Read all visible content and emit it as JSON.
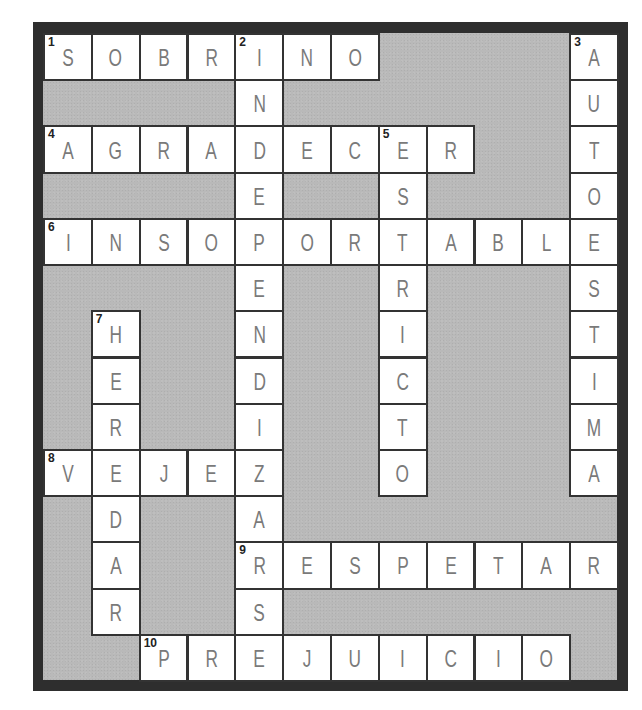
{
  "puzzle": {
    "type": "crossword",
    "columns": 12,
    "rows": 14,
    "colors": {
      "border": "#2e2e2e",
      "block": "#b9b9b9",
      "cell": "#ffffff",
      "letter": "#7a7a7a",
      "number": "#222222"
    }
  },
  "words": [
    {
      "number": 1,
      "direction": "across",
      "answer": "SOBRINO",
      "row": 0,
      "col": 0
    },
    {
      "number": 2,
      "direction": "down",
      "answer": "INDEPENDIZARS",
      "row": 0,
      "col": 4
    },
    {
      "number": 3,
      "direction": "down",
      "answer": "AUTOESTIMA",
      "row": 0,
      "col": 11
    },
    {
      "number": 4,
      "direction": "across",
      "answer": "AGRADECER",
      "row": 2,
      "col": 0
    },
    {
      "number": 5,
      "direction": "down",
      "answer": "ESTRICTO",
      "row": 2,
      "col": 7
    },
    {
      "number": 6,
      "direction": "across",
      "answer": "INSOPORTABLE",
      "row": 4,
      "col": 0
    },
    {
      "number": 7,
      "direction": "down",
      "answer": "HEREDAR",
      "row": 6,
      "col": 1
    },
    {
      "number": 8,
      "direction": "across",
      "answer": "VEJEZ",
      "row": 9,
      "col": 0
    },
    {
      "number": 9,
      "direction": "across",
      "answer": "RESPETAR",
      "row": 11,
      "col": 4
    },
    {
      "number": 10,
      "direction": "across",
      "answer": "PREJUICIO",
      "row": 13,
      "col": 2
    }
  ],
  "cells": [
    {
      "r": 0,
      "c": 0,
      "letter": "S",
      "num": "1"
    },
    {
      "r": 0,
      "c": 1,
      "letter": "O"
    },
    {
      "r": 0,
      "c": 2,
      "letter": "B"
    },
    {
      "r": 0,
      "c": 3,
      "letter": "R"
    },
    {
      "r": 0,
      "c": 4,
      "letter": "I",
      "num": "2"
    },
    {
      "r": 0,
      "c": 5,
      "letter": "N"
    },
    {
      "r": 0,
      "c": 6,
      "letter": "O"
    },
    {
      "r": 0,
      "c": 11,
      "letter": "A",
      "num": "3"
    },
    {
      "r": 1,
      "c": 4,
      "letter": "N"
    },
    {
      "r": 1,
      "c": 11,
      "letter": "U"
    },
    {
      "r": 2,
      "c": 0,
      "letter": "A",
      "num": "4"
    },
    {
      "r": 2,
      "c": 1,
      "letter": "G"
    },
    {
      "r": 2,
      "c": 2,
      "letter": "R"
    },
    {
      "r": 2,
      "c": 3,
      "letter": "A"
    },
    {
      "r": 2,
      "c": 4,
      "letter": "D"
    },
    {
      "r": 2,
      "c": 5,
      "letter": "E"
    },
    {
      "r": 2,
      "c": 6,
      "letter": "C"
    },
    {
      "r": 2,
      "c": 7,
      "letter": "E",
      "num": "5"
    },
    {
      "r": 2,
      "c": 8,
      "letter": "R"
    },
    {
      "r": 2,
      "c": 11,
      "letter": "T"
    },
    {
      "r": 3,
      "c": 4,
      "letter": "E"
    },
    {
      "r": 3,
      "c": 7,
      "letter": "S"
    },
    {
      "r": 3,
      "c": 11,
      "letter": "O"
    },
    {
      "r": 4,
      "c": 0,
      "letter": "I",
      "num": "6"
    },
    {
      "r": 4,
      "c": 1,
      "letter": "N"
    },
    {
      "r": 4,
      "c": 2,
      "letter": "S"
    },
    {
      "r": 4,
      "c": 3,
      "letter": "O"
    },
    {
      "r": 4,
      "c": 4,
      "letter": "P"
    },
    {
      "r": 4,
      "c": 5,
      "letter": "O"
    },
    {
      "r": 4,
      "c": 6,
      "letter": "R"
    },
    {
      "r": 4,
      "c": 7,
      "letter": "T"
    },
    {
      "r": 4,
      "c": 8,
      "letter": "A"
    },
    {
      "r": 4,
      "c": 9,
      "letter": "B"
    },
    {
      "r": 4,
      "c": 10,
      "letter": "L"
    },
    {
      "r": 4,
      "c": 11,
      "letter": "E"
    },
    {
      "r": 5,
      "c": 4,
      "letter": "E"
    },
    {
      "r": 5,
      "c": 7,
      "letter": "R"
    },
    {
      "r": 5,
      "c": 11,
      "letter": "S"
    },
    {
      "r": 6,
      "c": 1,
      "letter": "H",
      "num": "7"
    },
    {
      "r": 6,
      "c": 4,
      "letter": "N"
    },
    {
      "r": 6,
      "c": 7,
      "letter": "I"
    },
    {
      "r": 6,
      "c": 11,
      "letter": "T"
    },
    {
      "r": 7,
      "c": 1,
      "letter": "E"
    },
    {
      "r": 7,
      "c": 4,
      "letter": "D"
    },
    {
      "r": 7,
      "c": 7,
      "letter": "C"
    },
    {
      "r": 7,
      "c": 11,
      "letter": "I"
    },
    {
      "r": 8,
      "c": 1,
      "letter": "R"
    },
    {
      "r": 8,
      "c": 4,
      "letter": "I"
    },
    {
      "r": 8,
      "c": 7,
      "letter": "T"
    },
    {
      "r": 8,
      "c": 11,
      "letter": "M"
    },
    {
      "r": 9,
      "c": 0,
      "letter": "V",
      "num": "8"
    },
    {
      "r": 9,
      "c": 1,
      "letter": "E"
    },
    {
      "r": 9,
      "c": 2,
      "letter": "J"
    },
    {
      "r": 9,
      "c": 3,
      "letter": "E"
    },
    {
      "r": 9,
      "c": 4,
      "letter": "Z"
    },
    {
      "r": 9,
      "c": 7,
      "letter": "O"
    },
    {
      "r": 9,
      "c": 11,
      "letter": "A"
    },
    {
      "r": 10,
      "c": 1,
      "letter": "D"
    },
    {
      "r": 10,
      "c": 4,
      "letter": "A"
    },
    {
      "r": 11,
      "c": 1,
      "letter": "A"
    },
    {
      "r": 11,
      "c": 4,
      "letter": "R",
      "num": "9"
    },
    {
      "r": 11,
      "c": 5,
      "letter": "E"
    },
    {
      "r": 11,
      "c": 6,
      "letter": "S"
    },
    {
      "r": 11,
      "c": 7,
      "letter": "P"
    },
    {
      "r": 11,
      "c": 8,
      "letter": "E"
    },
    {
      "r": 11,
      "c": 9,
      "letter": "T"
    },
    {
      "r": 11,
      "c": 10,
      "letter": "A"
    },
    {
      "r": 11,
      "c": 11,
      "letter": "R"
    },
    {
      "r": 12,
      "c": 1,
      "letter": "R"
    },
    {
      "r": 12,
      "c": 4,
      "letter": "S"
    },
    {
      "r": 13,
      "c": 2,
      "letter": "P",
      "num": "10"
    },
    {
      "r": 13,
      "c": 3,
      "letter": "R"
    },
    {
      "r": 13,
      "c": 4,
      "letter": "E"
    },
    {
      "r": 13,
      "c": 5,
      "letter": "J"
    },
    {
      "r": 13,
      "c": 6,
      "letter": "U"
    },
    {
      "r": 13,
      "c": 7,
      "letter": "I"
    },
    {
      "r": 13,
      "c": 8,
      "letter": "C"
    },
    {
      "r": 13,
      "c": 9,
      "letter": "I"
    },
    {
      "r": 13,
      "c": 10,
      "letter": "O"
    }
  ]
}
